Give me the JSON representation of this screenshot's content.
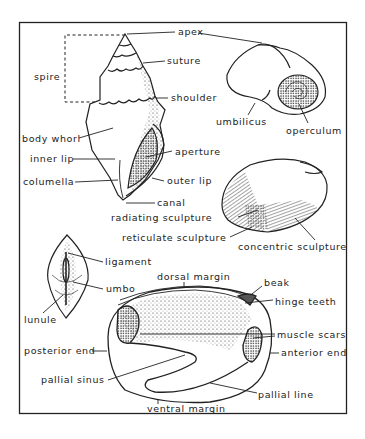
{
  "figure": {
    "ink_color": "#222222",
    "background": "#ffffff"
  },
  "gastropod_high_spire": {
    "labels": {
      "apex": "apex",
      "suture": "suture",
      "spire": "spire",
      "shoulder": "shoulder",
      "body_whorl": "body whorl",
      "inner_lip": "inner lip",
      "aperture": "aperture",
      "columella": "columella",
      "outer_lip": "outer lip",
      "canal": "canal"
    }
  },
  "gastropod_low_spire": {
    "labels": {
      "umbilicus": "umbilicus",
      "operculum": "operculum"
    }
  },
  "bivalve_exterior": {
    "labels": {
      "radiating_sculpture": "radiating sculpture",
      "reticulate_sculpture": "reticulate sculpture",
      "concentric_sculpture": "concentric sculpture"
    }
  },
  "bivalve_dorsal": {
    "labels": {
      "ligament": "ligament",
      "umbo": "umbo",
      "lunule": "lunule"
    }
  },
  "bivalve_interior": {
    "labels": {
      "dorsal_margin": "dorsal margin",
      "beak": "beak",
      "hinge_teeth": "hinge teeth",
      "muscle_scars": "muscle scars",
      "posterior_end": "posterior end",
      "anterior_end": "anterior end",
      "pallial_sinus": "pallial sinus",
      "pallial_line": "pallial line",
      "ventral_margin": "ventral margin"
    }
  }
}
